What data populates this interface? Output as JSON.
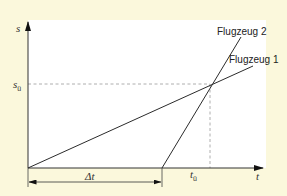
{
  "diagram": {
    "axes": {
      "y_label": "s",
      "x_label": "t",
      "y_marker_label": "s",
      "y_marker_sub": "ü",
      "x_marker_label": "t",
      "x_marker_sub": "ü",
      "delta_label": "Δt"
    },
    "lines": [
      {
        "name": "Flugzeug 1",
        "label": "Flugzeug 1"
      },
      {
        "name": "Flugzeug 2",
        "label": "Flugzeug 2"
      }
    ],
    "colors": {
      "background": "#fbf8dc",
      "plot": "#ffffff",
      "line": "#2b2b2b",
      "dashed": "#9a9a9a"
    }
  }
}
